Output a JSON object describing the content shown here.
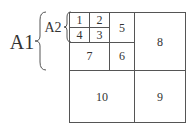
{
  "diagram": {
    "outer_label": "A1",
    "inner_label": "A2",
    "cells": [
      {
        "id": "1",
        "label": "1"
      },
      {
        "id": "2",
        "label": "2"
      },
      {
        "id": "3",
        "label": "3"
      },
      {
        "id": "4",
        "label": "4"
      },
      {
        "id": "5",
        "label": "5"
      },
      {
        "id": "6",
        "label": "6"
      },
      {
        "id": "7",
        "label": "7"
      },
      {
        "id": "8",
        "label": "8"
      },
      {
        "id": "9",
        "label": "9"
      },
      {
        "id": "10",
        "label": "10"
      }
    ],
    "line_color": "#555555"
  }
}
